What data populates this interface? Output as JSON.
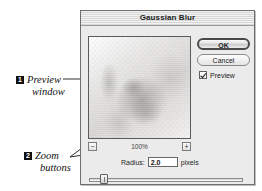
{
  "dialog": {
    "title": "Gaussian Blur",
    "buttons": {
      "ok_label": "OK",
      "cancel_label": "Cancel"
    },
    "preview_checkbox": {
      "label": "Preview",
      "checked": "true"
    },
    "preview_pane": {
      "zoom_level": "100%",
      "zoom_out_glyph": "−",
      "zoom_in_glyph": "+"
    },
    "radius": {
      "label": "Radius:",
      "value": "2.0",
      "units": "pixels"
    }
  },
  "annotations": [
    {
      "number": "1",
      "word1": "Preview",
      "word2": "window"
    },
    {
      "number": "2",
      "word1": "Zoom",
      "word2": "buttons"
    }
  ],
  "colors": {
    "dialog_background": "#ebebeb",
    "dialog_border": "#6e6e6e",
    "title_stripe_light": "#f3f3f3",
    "title_stripe_dark": "#d6d6d6",
    "default_button_border": "#4a4a4a",
    "annotation_marker": "#111111",
    "leader_line": "#1a1a1a"
  }
}
